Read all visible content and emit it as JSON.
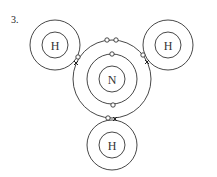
{
  "question_number": "3.",
  "molecule": "NH3",
  "atoms": [
    {
      "id": "N",
      "label": "N",
      "cx": 112,
      "cy": 79,
      "nucleus_r": 13,
      "shells": [
        25,
        39
      ]
    },
    {
      "id": "H1",
      "label": "H",
      "cx": 55,
      "cy": 45,
      "nucleus_r": 13,
      "shells": [
        25
      ]
    },
    {
      "id": "H2",
      "label": "H",
      "cx": 168,
      "cy": 45,
      "nucleus_r": 13,
      "shells": [
        25
      ]
    },
    {
      "id": "H3",
      "label": "H",
      "cx": 112,
      "cy": 145,
      "nucleus_r": 13,
      "shells": [
        25
      ]
    }
  ],
  "electron_markers": {
    "nitrogen": "o",
    "hydrogen": "x"
  },
  "colors": {
    "line": "#333333",
    "background": "#ffffff"
  }
}
